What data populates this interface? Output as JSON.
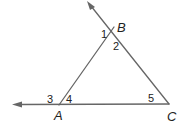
{
  "diagram": {
    "type": "triangle-exterior-angles",
    "colors": {
      "line": "#666666",
      "text": "#222222",
      "background": "#ffffff"
    },
    "vertices": [
      {
        "id": "A",
        "label": "A",
        "x": 59,
        "y": 105
      },
      {
        "id": "B",
        "label": "B",
        "x": 114,
        "y": 27
      },
      {
        "id": "C",
        "label": "C",
        "x": 169,
        "y": 104
      }
    ],
    "rays": [
      {
        "from": "C",
        "through": "B",
        "arrow_end": {
          "x": 88,
          "y": 2
        }
      },
      {
        "from": "C",
        "through": "A",
        "arrow_end": {
          "x": 14,
          "y": 105
        }
      }
    ],
    "angle_labels": [
      {
        "label": "1",
        "x": 101,
        "y": 38
      },
      {
        "label": "2",
        "x": 113,
        "y": 50
      },
      {
        "label": "3",
        "x": 47,
        "y": 103
      },
      {
        "label": "4",
        "x": 66,
        "y": 103
      },
      {
        "label": "5",
        "x": 148,
        "y": 102
      }
    ],
    "vertex_label_positions": [
      {
        "label": "B",
        "x": 117,
        "y": 32
      },
      {
        "label": "A",
        "x": 54,
        "y": 120
      },
      {
        "label": "C",
        "x": 167,
        "y": 121
      }
    ]
  }
}
